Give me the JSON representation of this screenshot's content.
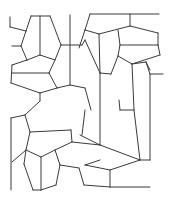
{
  "figure": {
    "stroke_color": "#3a3a3a",
    "background": "#ffffff",
    "width": 171,
    "height": 202
  },
  "segments": [
    [
      31,
      16,
      50,
      16
    ],
    [
      31,
      16,
      26,
      31
    ],
    [
      26,
      31,
      21,
      46
    ],
    [
      21,
      46,
      27,
      60
    ],
    [
      40,
      16,
      40,
      55
    ],
    [
      50,
      16,
      61,
      45
    ],
    [
      61,
      45,
      55,
      60
    ],
    [
      40,
      55,
      27,
      60
    ],
    [
      40,
      55,
      55,
      60
    ],
    [
      10,
      17,
      10,
      27
    ],
    [
      10,
      27,
      26,
      31
    ],
    [
      12,
      46,
      21,
      46
    ],
    [
      70,
      15,
      70,
      85
    ],
    [
      61,
      45,
      82,
      45
    ],
    [
      82,
      45,
      85,
      40
    ],
    [
      27,
      60,
      12,
      65
    ],
    [
      12,
      65,
      11,
      83
    ],
    [
      11,
      83,
      40,
      93
    ],
    [
      40,
      93,
      57,
      88
    ],
    [
      57,
      88,
      70,
      85
    ],
    [
      70,
      85,
      85,
      88
    ],
    [
      55,
      60,
      49,
      73
    ],
    [
      49,
      73,
      57,
      88
    ],
    [
      12,
      73,
      49,
      73
    ],
    [
      40,
      93,
      40,
      101
    ],
    [
      90,
      14,
      159,
      14
    ],
    [
      130,
      14,
      130,
      26
    ],
    [
      90,
      14,
      85,
      30
    ],
    [
      85,
      30,
      99,
      34
    ],
    [
      99,
      34,
      130,
      26
    ],
    [
      130,
      26,
      158,
      33
    ],
    [
      158,
      33,
      158,
      45
    ],
    [
      118,
      30,
      120,
      45
    ],
    [
      120,
      45,
      158,
      45
    ],
    [
      158,
      45,
      160,
      55
    ],
    [
      160,
      55,
      132,
      64
    ],
    [
      132,
      64,
      118,
      56
    ],
    [
      118,
      56,
      120,
      45
    ],
    [
      99,
      34,
      100,
      73
    ],
    [
      85,
      30,
      79,
      48
    ],
    [
      85,
      40,
      100,
      73
    ],
    [
      100,
      73,
      100,
      145
    ],
    [
      100,
      73,
      111,
      74
    ],
    [
      111,
      74,
      118,
      56
    ],
    [
      132,
      64,
      134,
      110
    ],
    [
      132,
      64,
      146,
      62
    ],
    [
      146,
      62,
      150,
      74
    ],
    [
      150,
      74,
      150,
      160
    ],
    [
      150,
      74,
      163,
      74
    ],
    [
      146,
      62,
      150,
      70
    ],
    [
      85,
      88,
      91,
      110
    ],
    [
      85,
      110,
      82,
      135
    ],
    [
      80,
      135,
      100,
      145
    ],
    [
      40,
      101,
      25,
      115
    ],
    [
      25,
      115,
      11,
      118
    ],
    [
      11,
      118,
      11,
      190
    ],
    [
      25,
      115,
      30,
      132
    ],
    [
      30,
      132,
      71,
      130
    ],
    [
      30,
      132,
      26,
      150
    ],
    [
      26,
      150,
      41,
      157
    ],
    [
      41,
      157,
      41,
      190
    ],
    [
      26,
      150,
      12,
      162
    ],
    [
      71,
      130,
      72,
      142
    ],
    [
      72,
      142,
      100,
      145
    ],
    [
      72,
      142,
      55,
      150
    ],
    [
      55,
      150,
      41,
      157
    ],
    [
      55,
      150,
      60,
      165
    ],
    [
      60,
      165,
      56,
      185
    ],
    [
      56,
      185,
      41,
      190
    ],
    [
      41,
      190,
      33,
      190
    ],
    [
      33,
      190,
      24,
      164
    ],
    [
      24,
      164,
      26,
      150
    ],
    [
      60,
      165,
      79,
      168
    ],
    [
      79,
      168,
      84,
      185
    ],
    [
      84,
      185,
      110,
      187
    ],
    [
      110,
      187,
      150,
      187
    ],
    [
      110,
      187,
      110,
      170
    ],
    [
      110,
      170,
      140,
      160
    ],
    [
      140,
      160,
      150,
      160
    ],
    [
      100,
      145,
      140,
      160
    ],
    [
      134,
      110,
      140,
      160
    ],
    [
      120,
      110,
      134,
      110
    ],
    [
      119,
      100,
      120,
      110
    ],
    [
      85,
      165,
      110,
      170
    ],
    [
      100,
      160,
      85,
      165
    ]
  ]
}
